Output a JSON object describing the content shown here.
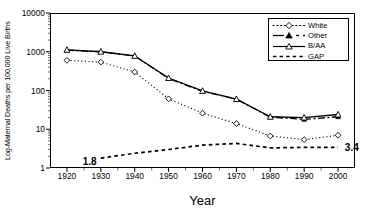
{
  "chart_data": {
    "type": "line",
    "title": "",
    "xlabel": "Year",
    "ylabel": "Log-Maternal Deaths per 100,000 Live Births",
    "x": [
      1920,
      1930,
      1940,
      1950,
      1960,
      1970,
      1980,
      1990,
      2000
    ],
    "xtick_labels": [
      "1920",
      "1930",
      "1940",
      "1950",
      "1960",
      "1970",
      "1980",
      "1990",
      "2000"
    ],
    "xlim": [
      1915,
      2005
    ],
    "ylim": [
      1,
      10000
    ],
    "yscale": "log",
    "ytick_labels": [
      "1",
      "10",
      "100",
      "1000",
      "10000"
    ],
    "ytick_values": [
      1,
      10,
      100,
      1000,
      10000
    ],
    "grid": false,
    "legend_position": "top-right",
    "series": [
      {
        "name": "White",
        "label": "White",
        "marker": "open-diamond",
        "linestyle": "dotted",
        "color": "#000000",
        "values": [
          600,
          540,
          300,
          61,
          26,
          14,
          6.7,
          5.4,
          7.0
        ]
      },
      {
        "name": "Other",
        "label": "Other",
        "marker": "filled-triangle",
        "linestyle": "dash-dot",
        "color": "#000000",
        "values": [
          1100,
          1000,
          780,
          205,
          95,
          60,
          20.5,
          18,
          21
        ]
      },
      {
        "name": "B/AA",
        "label": "B/AA",
        "marker": "open-triangle",
        "linestyle": "solid",
        "color": "#000000",
        "values": [
          1120,
          1000,
          780,
          210,
          98,
          60,
          21,
          20,
          24
        ]
      },
      {
        "name": "GAP",
        "label": "GAP",
        "marker": "none",
        "linestyle": "dashed",
        "color": "#000000",
        "values": [
          null,
          1.8,
          2.4,
          3.0,
          3.9,
          4.3,
          3.3,
          3.4,
          3.4
        ]
      }
    ],
    "annotations": [
      {
        "text": "1.8",
        "x": 1927,
        "y": 1.45,
        "series": "GAP"
      },
      {
        "text": "3.4",
        "x": 2002,
        "y": 3.2,
        "series": "GAP"
      }
    ]
  }
}
